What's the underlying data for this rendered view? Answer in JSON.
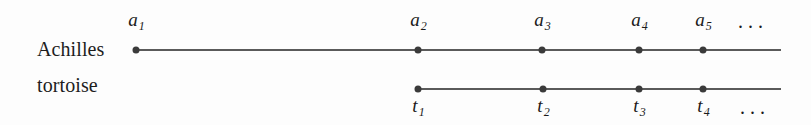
{
  "figure": {
    "width": 811,
    "height": 125,
    "background_color": "#fdfdfd",
    "line_color": "#5a5a5a",
    "point_color": "#3a3a3a",
    "text_color": "#1a1a1a"
  },
  "rows": [
    {
      "id": "achilles",
      "name": "Achilles",
      "label": "Achilles",
      "label_x": 37,
      "label_y": 38,
      "line": {
        "x_start": 136,
        "x_end": 781,
        "y": 49
      },
      "tick_position": "above",
      "points": [
        {
          "label_base": "a",
          "label_sub": "1",
          "x": 136,
          "y": 50
        },
        {
          "label_base": "a",
          "label_sub": "2",
          "x": 418,
          "y": 50
        },
        {
          "label_base": "a",
          "label_sub": "3",
          "x": 542,
          "y": 50
        },
        {
          "label_base": "a",
          "label_sub": "4",
          "x": 639,
          "y": 50
        },
        {
          "label_base": "a",
          "label_sub": "5",
          "x": 703,
          "y": 50
        }
      ],
      "ellipsis": {
        "text": "...",
        "x": 753,
        "y": 10
      }
    },
    {
      "id": "tortoise",
      "name": "tortoise",
      "label": "tortoise",
      "label_x": 37,
      "label_y": 74,
      "line": {
        "x_start": 418,
        "x_end": 781,
        "y": 88
      },
      "tick_position": "below",
      "points": [
        {
          "label_base": "t",
          "label_sub": "1",
          "x": 418,
          "y": 89
        },
        {
          "label_base": "t",
          "label_sub": "2",
          "x": 543,
          "y": 89
        },
        {
          "label_base": "t",
          "label_sub": "3",
          "x": 639,
          "y": 89
        },
        {
          "label_base": "t",
          "label_sub": "4",
          "x": 703,
          "y": 89
        }
      ],
      "ellipsis": {
        "text": "...",
        "x": 755,
        "y": 96
      }
    }
  ]
}
